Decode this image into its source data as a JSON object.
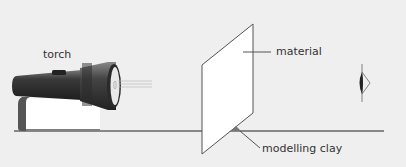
{
  "diagram": {
    "labels": {
      "torch": "torch",
      "material": "material",
      "clay": "modelling clay"
    },
    "colors": {
      "background": "#efefef",
      "torch_body": "#3a3a3a",
      "book": "#ffffff",
      "material": "#ffffff",
      "line": "#555555",
      "clay": "#777777"
    }
  }
}
